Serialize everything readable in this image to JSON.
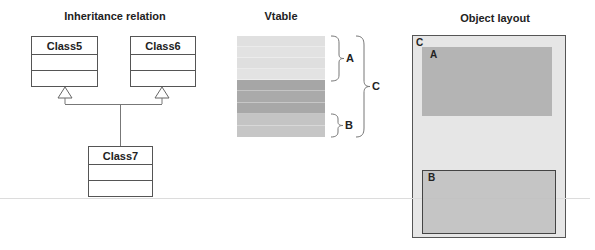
{
  "inheritance": {
    "title": "Inheritance relation",
    "classes": [
      {
        "name": "Class5"
      },
      {
        "name": "Class6"
      },
      {
        "name": "Class7"
      }
    ],
    "relation": "Class7 inherits from Class5 and Class6"
  },
  "vtable": {
    "title": "Vtable",
    "rows": [
      {
        "section": "A",
        "color": "#e0e0e0"
      },
      {
        "section": "A",
        "color": "#e0e0e0"
      },
      {
        "section": "A",
        "color": "#e0e0e0"
      },
      {
        "section": "A",
        "color": "#e0e0e0"
      },
      {
        "section": "C-only",
        "color": "#a8a8a8"
      },
      {
        "section": "C-only",
        "color": "#a8a8a8"
      },
      {
        "section": "C-only",
        "color": "#a8a8a8"
      },
      {
        "section": "B",
        "color": "#c4c4c4"
      },
      {
        "section": "B",
        "color": "#c4c4c4"
      }
    ],
    "braces": {
      "a": "A",
      "b": "B",
      "c": "C"
    }
  },
  "object_layout": {
    "title": "Object layout",
    "outer_label": "C",
    "outer_color": "#e6e6e6",
    "a_label": "A",
    "a_color": "#b4b4b4",
    "b_label": "B",
    "b_color": "#c8c8c8"
  }
}
